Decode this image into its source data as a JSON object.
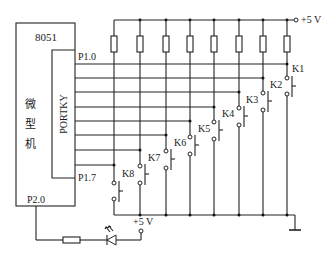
{
  "diagram": {
    "type": "circuit-schematic",
    "mcu": {
      "outer_label": "8051",
      "side_label_chars": [
        "微",
        "型",
        "机"
      ],
      "port_label": "PORTKY",
      "pin_top": "P1.0",
      "pin_bottom": "P1.7",
      "pin_led": "P2.0"
    },
    "supply_top": "+5 V",
    "supply_led": "+5 V",
    "switches": [
      {
        "label": "K1",
        "column_x": 287,
        "row_y": 64,
        "label_x": 292,
        "label_y": 74
      },
      {
        "label": "K2",
        "column_x": 263,
        "row_y": 78,
        "label_x": 270,
        "label_y": 89
      },
      {
        "label": "K3",
        "column_x": 239,
        "row_y": 92,
        "label_x": 246,
        "label_y": 103
      },
      {
        "label": "K4",
        "column_x": 214,
        "row_y": 107,
        "label_x": 222,
        "label_y": 118
      },
      {
        "label": "K5",
        "column_x": 190,
        "row_y": 121,
        "label_x": 198,
        "label_y": 133
      },
      {
        "label": "K6",
        "column_x": 166,
        "row_y": 135,
        "label_x": 174,
        "label_y": 147
      },
      {
        "label": "K7",
        "column_x": 140,
        "row_y": 150,
        "label_x": 148,
        "label_y": 162
      },
      {
        "label": "K8",
        "column_x": 114,
        "row_y": 165,
        "label_x": 122,
        "label_y": 177
      }
    ],
    "components": [
      "8 pull-up resistors",
      "8 push-button switches K1-K8",
      "current-limiting resistor",
      "LED",
      "ground"
    ]
  }
}
